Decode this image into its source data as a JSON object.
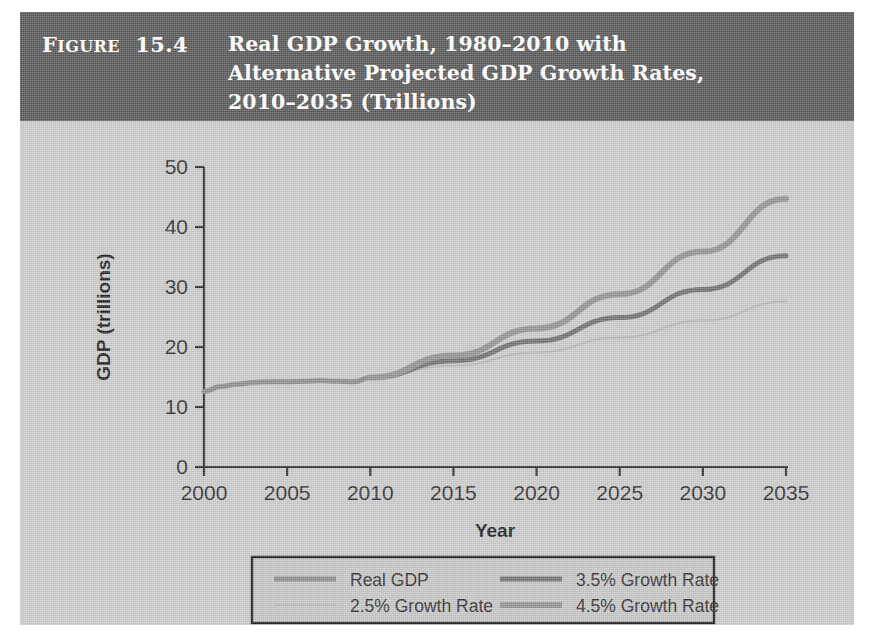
{
  "figure": {
    "label_prefix": "F",
    "label_caps": "IGURE",
    "label_number": "15.4",
    "title_line1": "Real GDP Growth, 1980–2010 with",
    "title_line2": "Alternative Projected GDP Growth Rates,",
    "title_line3": "2010–2035 (Trillions)",
    "banner_color": "#555555",
    "background_color": "#c9c9c9"
  },
  "chart_data": {
    "type": "line",
    "title": "Real GDP Growth, 1980–2010 with Alternative Projected GDP Growth Rates, 2010–2035 (Trillions)",
    "xlabel": "Year",
    "ylabel": "GDP (trillions)",
    "xlim": [
      2000,
      2035
    ],
    "ylim": [
      0,
      50
    ],
    "xticks": [
      2000,
      2005,
      2010,
      2015,
      2020,
      2025,
      2030,
      2035
    ],
    "yticks": [
      0,
      10,
      20,
      30,
      40,
      50
    ],
    "xtick_labels": [
      "2000",
      "2005",
      "2010",
      "2015",
      "2020",
      "2025",
      "2030",
      "2035"
    ],
    "ytick_labels": [
      "0",
      "10",
      "20",
      "30",
      "40",
      "50"
    ],
    "grid": false,
    "legend_position": "below-center",
    "series": [
      {
        "name": "Real GDP",
        "color": "#8a8a8a",
        "width": 5,
        "x": [
          2000,
          2001,
          2002,
          2003,
          2004,
          2005,
          2006,
          2007,
          2008,
          2009,
          2010
        ],
        "values": [
          12.6,
          13.4,
          13.8,
          14.1,
          14.2,
          14.2,
          14.3,
          14.4,
          14.3,
          14.2,
          14.9
        ]
      },
      {
        "name": "2.5% Growth Rate",
        "color": "#b4b4b4",
        "width": 2,
        "x": [
          2010,
          2015,
          2020,
          2025,
          2030,
          2035
        ],
        "values": [
          14.9,
          16.9,
          19.1,
          21.6,
          24.4,
          27.6
        ]
      },
      {
        "name": "3.5% Growth Rate",
        "color": "#6e6e6e",
        "width": 5,
        "x": [
          2010,
          2015,
          2020,
          2025,
          2030,
          2035
        ],
        "values": [
          14.9,
          17.7,
          21.0,
          24.9,
          29.6,
          35.2
        ]
      },
      {
        "name": "4.5% Growth Rate",
        "color": "#909090",
        "width": 6,
        "x": [
          2010,
          2015,
          2020,
          2025,
          2030,
          2035
        ],
        "values": [
          14.9,
          18.6,
          23.1,
          28.8,
          35.9,
          44.7
        ]
      }
    ],
    "legend_entries": [
      {
        "label": "Real GDP",
        "color": "#8a8a8a",
        "width": 5
      },
      {
        "label": "3.5% Growth Rate",
        "color": "#6e6e6e",
        "width": 5
      },
      {
        "label": "2.5% Growth Rate",
        "color": "#b4b4b4",
        "width": 2
      },
      {
        "label": "4.5% Growth Rate",
        "color": "#909090",
        "width": 6
      }
    ]
  }
}
